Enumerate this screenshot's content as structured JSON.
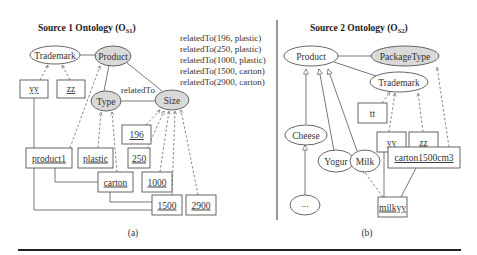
{
  "panel_a": {
    "title": "Source 1 Ontology (O",
    "title_sub": "S1",
    "title_end": ")",
    "caption": "(a)",
    "concepts": {
      "trademark": "Trademark",
      "product": "Product",
      "type": "Type",
      "size": "Size"
    },
    "edge_label": "relatedTo",
    "instances": {
      "yy": "yy",
      "zz": "zz",
      "product1": "product1",
      "plastic": "plastic",
      "i196": "196",
      "i250": "250",
      "carton": "carton",
      "i1000": "1000",
      "i1500": "1500",
      "i2900": "2900"
    },
    "relations": [
      "relatedTo(196, plastic)",
      "relatedTo(250, plastic)",
      "relatedTo(1000, plastic)",
      "relatedTo(1500, carton)",
      "relatedTo(2900, carton)"
    ]
  },
  "panel_b": {
    "title": "Source 2 Ontology (O",
    "title_sub": "S2",
    "title_end": ")",
    "caption": "(b)",
    "concepts": {
      "product": "Product",
      "packagetype": "PackageType",
      "trademark": "Trademark",
      "cheese": "Cheese",
      "yogur": "Yogur",
      "milk": "Milk",
      "ellipsis": "..."
    },
    "instances": {
      "tt": "tt",
      "yy": "yy",
      "zz": "zz",
      "carton1500cm3": "carton1500cm3",
      "milkyy": "milkyy"
    }
  },
  "colors": {
    "highlight_fill": "#d9d9d9",
    "stroke": "#555555",
    "rule": "#222222"
  }
}
